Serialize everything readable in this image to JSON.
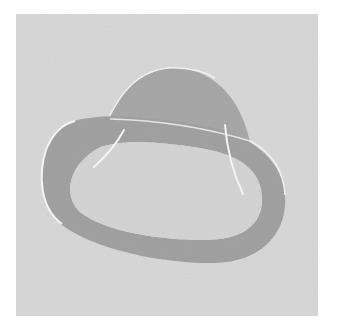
{
  "figure": {
    "colors": {
      "page_background": "#ffffff",
      "panel_background": "#d9d9d9",
      "dome_fill": "#a9a9a9",
      "ring_fill": "#a3a3a3",
      "inner_fill": "#d6d6d6",
      "highlight": "#f4f4f4"
    }
  }
}
